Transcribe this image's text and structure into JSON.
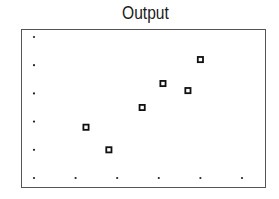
{
  "chart_data": {
    "type": "scatter",
    "title": "Output",
    "xlabel": "",
    "ylabel": "",
    "grid": "dots",
    "xlim": [
      0,
      5
    ],
    "ylim": [
      0,
      5
    ],
    "grid_ticks_x": [
      0,
      1,
      2,
      3,
      4,
      5
    ],
    "grid_ticks_y": [
      0,
      1,
      2,
      3,
      4,
      5
    ],
    "marker": "hollow-square",
    "points": [
      {
        "x": 1.25,
        "y": 1.8
      },
      {
        "x": 1.8,
        "y": 1.0
      },
      {
        "x": 2.6,
        "y": 2.5
      },
      {
        "x": 3.1,
        "y": 3.35
      },
      {
        "x": 3.7,
        "y": 3.1
      },
      {
        "x": 4.0,
        "y": 4.2
      }
    ]
  },
  "colors": {
    "marker": "#111111",
    "frame": "#555555",
    "grid_dot": "#222222"
  }
}
